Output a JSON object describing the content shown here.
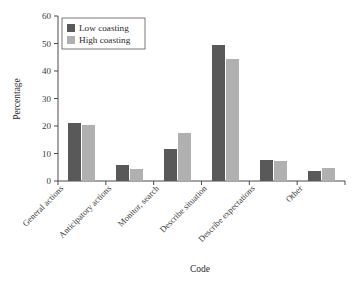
{
  "chart_data": {
    "type": "bar",
    "title": "",
    "xlabel": "Code",
    "ylabel": "Percentage",
    "categories": [
      "General actions",
      "Anticipatory actions",
      "Monitor, search",
      "Describe situation",
      "Describe expectations",
      "Other"
    ],
    "series": [
      {
        "name": "Low coasting",
        "color": "#595959",
        "values": [
          21.2,
          6.0,
          11.8,
          49.5,
          7.5,
          3.5
        ]
      },
      {
        "name": "High coasting",
        "color": "#b0b0b0",
        "values": [
          20.4,
          4.5,
          17.3,
          44.5,
          7.1,
          4.8
        ]
      }
    ],
    "ylim": [
      0,
      60
    ],
    "yticks": [
      0,
      10,
      20,
      30,
      40,
      50,
      60
    ],
    "ytick_labels": [
      "0",
      "10",
      "20",
      "30",
      "40",
      "50",
      "60"
    ],
    "grid": false,
    "legend_position": "top-left"
  },
  "legend": {
    "entries": [
      {
        "label": "Low coasting",
        "swatch": "#595959"
      },
      {
        "label": "High coasting",
        "swatch": "#b0b0b0"
      }
    ]
  }
}
